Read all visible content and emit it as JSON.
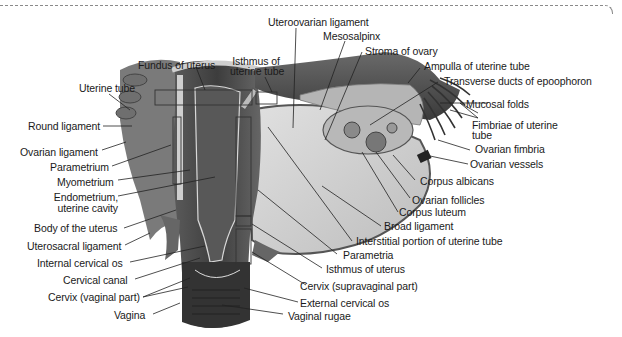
{
  "figure": {
    "colors": {
      "tissue_dark": "#4a4a4a",
      "tissue_mid": "#7d7d7d",
      "tissue_light": "#c9c9c9",
      "ligament": "#b3b3b3",
      "leader": "#222222"
    }
  },
  "labels": {
    "uteroovarian_ligament": "Uteroovarian ligament",
    "mesosalpinx": "Mesosalpinx",
    "stroma_of_ovary": "Stroma of ovary",
    "fundus_of_uterus": "Fundus of uterus",
    "isthmus_of_uterine_tube_1": "Isthmus of",
    "isthmus_of_uterine_tube_2": "uterine tube",
    "ampulla_of_uterine_tube": "Ampulla of uterine tube",
    "transverse_ducts": "Transverse ducts of epoophoron",
    "uterine_tube": "Uterine tube",
    "mucosal_folds": "Mucosal folds",
    "round_ligament": "Round ligament",
    "fimbriae_1": "Fimbriae of uterine",
    "fimbriae_2": "tube",
    "ovarian_ligament": "Ovarian ligament",
    "ovarian_fimbria": "Ovarian fimbria",
    "parametrium": "Parametrium",
    "ovarian_vessels": "Ovarian vessels",
    "myometrium": "Myometrium",
    "corpus_albicans": "Corpus albicans",
    "endometrium_1": "Endometrium,",
    "endometrium_2": "uterine cavity",
    "ovarian_follicles": "Ovarian follicles",
    "corpus_luteum": "Corpus luteum",
    "body_of_uterus": "Body of the uterus",
    "broad_ligament": "Broad ligament",
    "interstitial_portion": "Interstitial portion of uterine tube",
    "uterosacral_ligament": "Uterosacral ligament",
    "parametria": "Parametria",
    "internal_cervical_os": "Internal cervical os",
    "isthmus_of_uterus": "Isthmus of uterus",
    "cervical_canal": "Cervical canal",
    "cervix_supravaginal": "Cervix (supravaginal part)",
    "cervix_vaginal": "Cervix (vaginal part)",
    "external_cervical_os": "External cervical os",
    "vagina": "Vagina",
    "vaginal_rugae": "Vaginal rugae"
  }
}
